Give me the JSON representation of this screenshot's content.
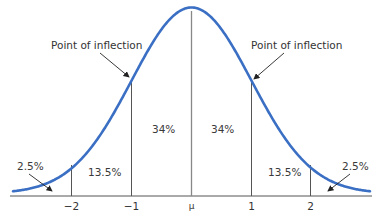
{
  "colors": {
    "curve": "#3a6fc4",
    "lines": "#555555",
    "text": "#333333",
    "background": "#ffffff"
  },
  "annotations": {
    "left_inflection": "Point of inflection",
    "right_inflection": "Point of inflection"
  },
  "regions": [
    {
      "id": "left-tail",
      "label": "2.5%"
    },
    {
      "id": "left-13",
      "label": "13.5%"
    },
    {
      "id": "left-34",
      "label": "34%"
    },
    {
      "id": "right-34",
      "label": "34%"
    },
    {
      "id": "right-13",
      "label": "13.5%"
    },
    {
      "id": "right-tail",
      "label": "2.5%"
    }
  ],
  "axis": {
    "ticks": [
      "−2",
      "−1",
      "μ",
      "1",
      "2"
    ]
  },
  "chart_data": {
    "type": "area",
    "title": "",
    "xlabel": "",
    "ylabel": "",
    "x_ticks": [
      "−2",
      "−1",
      "μ",
      "1",
      "2"
    ],
    "x_tick_values": [
      -2,
      -1,
      0,
      1,
      2
    ],
    "curve": "normal density (bell curve)",
    "regions": [
      {
        "from": "-inf",
        "to": -2,
        "percent": 2.5
      },
      {
        "from": -2,
        "to": -1,
        "percent": 13.5
      },
      {
        "from": -1,
        "to": 0,
        "percent": 34
      },
      {
        "from": 0,
        "to": 1,
        "percent": 34
      },
      {
        "from": 1,
        "to": 2,
        "percent": 13.5
      },
      {
        "from": 2,
        "to": "inf",
        "percent": 2.5
      }
    ],
    "annotations": [
      {
        "text": "Point of inflection",
        "at_x": -1
      },
      {
        "text": "Point of inflection",
        "at_x": 1
      }
    ],
    "grid": false,
    "legend": null
  }
}
